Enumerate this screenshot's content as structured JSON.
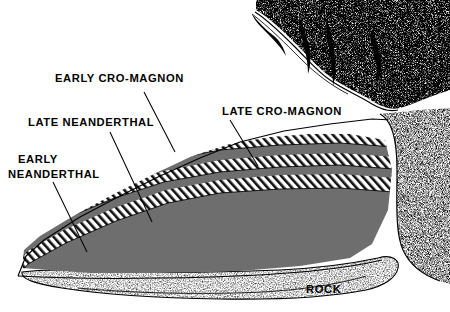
{
  "figure": {
    "background_color": "#ffffff",
    "ink_color": "#000000",
    "gray_layer_color": "#6e6e6e",
    "hatch_color": "#000000"
  },
  "labels": {
    "early_cro_magnon": "EARLY CRO-MAGNON",
    "late_neanderthal": "LATE NEANDERTHAL",
    "early_neanderthal_line1": "EARLY",
    "early_neanderthal_line2": "NEANDERTHAL",
    "late_cro_magnon": "LATE CRO-MAGNON",
    "rock": "ROCK"
  },
  "strata": [
    {
      "id": "layer-late-cro-magnon-hatch",
      "name": "Late Cro-Magnon occupation layer",
      "fill": "hatch",
      "order": 1
    },
    {
      "id": "layer-gray-1",
      "name": "Sterile band 1",
      "fill": "gray",
      "order": 2
    },
    {
      "id": "layer-early-cro-magnon-hatch",
      "name": "Early Cro-Magnon occupation layer",
      "fill": "hatch",
      "order": 3
    },
    {
      "id": "layer-gray-2",
      "name": "Sterile band 2",
      "fill": "gray",
      "order": 4
    },
    {
      "id": "layer-late-neanderthal-hatch",
      "name": "Late Neanderthal occupation layer",
      "fill": "hatch",
      "order": 5
    },
    {
      "id": "layer-gray-3",
      "name": "Sterile band 3",
      "fill": "gray",
      "order": 6
    },
    {
      "id": "layer-early-neanderthal-hatch",
      "name": "Early Neanderthal occupation layer",
      "fill": "hatch",
      "order": 7
    },
    {
      "id": "layer-gray-4",
      "name": "Basal deposit",
      "fill": "gray",
      "order": 8
    },
    {
      "id": "layer-bedrock",
      "name": "Bedrock",
      "fill": "stipple",
      "order": 9
    }
  ]
}
